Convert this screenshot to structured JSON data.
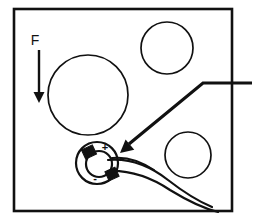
{
  "figure": {
    "background_color": "#ffffff",
    "stroke_color": "#111111",
    "frame": {
      "name": "specimen-frame",
      "x": 14,
      "y": 9,
      "width": 218,
      "height": 202,
      "stroke_width": 2.6
    },
    "force": {
      "label": "F",
      "label_x": 35,
      "label_y": 45,
      "arrow_x": 39,
      "arrow_top_y": 50,
      "arrow_bottom_y": 103,
      "stroke_width": 2.4
    },
    "circles": [
      {
        "name": "large-circle",
        "cx": 88,
        "cy": 95,
        "r": 40,
        "stroke_width": 1.7
      },
      {
        "name": "top-right-circle",
        "cx": 167,
        "cy": 48,
        "r": 26,
        "stroke_width": 1.7
      },
      {
        "name": "bottom-right-circle",
        "cx": 188,
        "cy": 155,
        "r": 23,
        "stroke_width": 1.7
      }
    ],
    "leader": {
      "name": "callout-leader-line",
      "right_end_x": 252,
      "elbow_x": 203,
      "y": 83,
      "tip_x": 120,
      "tip_y": 153,
      "stroke_width": 3.2,
      "arrow_size": 13
    },
    "coin_cell": {
      "name": "coin-cell-detail",
      "outer_cx": 97,
      "outer_cy": 163,
      "outer_r": 21,
      "inner_cx": 99,
      "inner_cy": 164,
      "inner_r": 13,
      "plus_label": "+",
      "plus_x": 105,
      "plus_y": 151,
      "minus_label": "-",
      "minus_x": 95,
      "minus_y": 182,
      "positive_tab": {
        "cx": 89,
        "cy": 152,
        "w": 12,
        "h": 10,
        "rotate": -25
      },
      "negative_tab": {
        "cx": 112,
        "cy": 174,
        "w": 11,
        "h": 10,
        "rotate": -25
      }
    },
    "wires": [
      {
        "name": "upper-lead-wire",
        "path": "M 108 160 C 130 158 150 166 168 180 C 186 194 200 202 212 207",
        "stroke_width": 2.2
      },
      {
        "name": "lower-lead-wire",
        "path": "M 108 171 C 132 170 152 178 170 190 C 188 201 202 208 218 212",
        "stroke_width": 2.2
      },
      {
        "name": "tab-connector-wire",
        "path": "M 112 158 C 128 156 142 162 154 170",
        "stroke_width": 2.0
      }
    ]
  }
}
